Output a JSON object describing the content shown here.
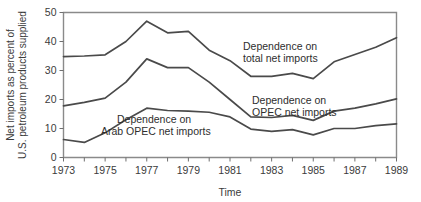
{
  "chart_data": {
    "type": "line",
    "title": "",
    "xlabel": "Time",
    "ylabel": "Net imports as percent of U.S. petroleum products supplied",
    "ylabel_line1": "Net imports as percent of",
    "ylabel_line2": "U.S. petroleum products supplied",
    "xlim": [
      1973,
      1989
    ],
    "ylim": [
      0,
      50
    ],
    "grid": false,
    "legend_position": "inline-annotations",
    "x": [
      1973,
      1974,
      1975,
      1976,
      1977,
      1978,
      1979,
      1980,
      1981,
      1982,
      1983,
      1984,
      1985,
      1986,
      1987,
      1988,
      1989
    ],
    "x_tick_values": [
      1973,
      1974,
      1975,
      1976,
      1977,
      1978,
      1979,
      1980,
      1981,
      1982,
      1983,
      1984,
      1985,
      1986,
      1987,
      1988,
      1989
    ],
    "x_tick_labels": [
      "1973",
      "",
      "1975",
      "",
      "1977",
      "",
      "1979",
      "",
      "1981",
      "",
      "1983",
      "",
      "1985",
      "",
      "1987",
      "",
      "1989"
    ],
    "x_labeled_ticks": [
      "1973",
      "1975",
      "1977",
      "1979",
      "1981",
      "1983",
      "1985",
      "1987",
      "1989"
    ],
    "y_tick_values": [
      0,
      10,
      20,
      30,
      40,
      50
    ],
    "y_tick_labels": [
      "0",
      "10",
      "20",
      "30",
      "40",
      "50"
    ],
    "series": [
      {
        "name": "Dependence on total net imports",
        "label_line1": "Dependence on",
        "label_line2": "total net imports",
        "color": "#4a4a4a",
        "values": [
          34.8,
          35.0,
          35.4,
          40.0,
          47.0,
          43.0,
          43.5,
          37.0,
          33.4,
          28.0,
          28.0,
          29.0,
          27.2,
          33.0,
          35.5,
          38.0,
          41.3
        ]
      },
      {
        "name": "Dependence on OPEC net imports",
        "label_line1": "Dependence on",
        "label_line2": "OPEC net imports",
        "color": "#4a4a4a",
        "values": [
          17.8,
          19.0,
          20.5,
          26.0,
          34.0,
          31.0,
          31.0,
          26.0,
          20.0,
          14.0,
          13.8,
          14.5,
          12.8,
          16.0,
          17.0,
          18.5,
          20.2
        ]
      },
      {
        "name": "Dependence on Arab OPEC net imports",
        "label_line1": "Dependence on",
        "label_line2": "Arab OPEC net imports",
        "color": "#4a4a4a",
        "values": [
          6.2,
          5.2,
          8.5,
          13.0,
          17.0,
          16.2,
          16.0,
          15.6,
          14.0,
          9.8,
          9.0,
          9.6,
          7.8,
          10.0,
          10.0,
          11.0,
          11.6
        ]
      }
    ],
    "annotations": [
      {
        "text_line1": "Dependence on",
        "text_line2": "total net imports",
        "series": 0
      },
      {
        "text_line1": "Dependence on",
        "text_line2": "OPEC net imports",
        "series": 1
      },
      {
        "text_line1": "Dependence on",
        "text_line2": "Arab OPEC net imports",
        "series": 2
      }
    ]
  },
  "axis": {
    "x_title": "Time",
    "y_title_line1": "Net imports as percent of",
    "y_title_line2": "U.S. petroleum products supplied"
  },
  "colors": {
    "line": "#4a4a4a",
    "axis": "#8a8a8a",
    "text": "#3b3b3b",
    "background": "#ffffff"
  }
}
